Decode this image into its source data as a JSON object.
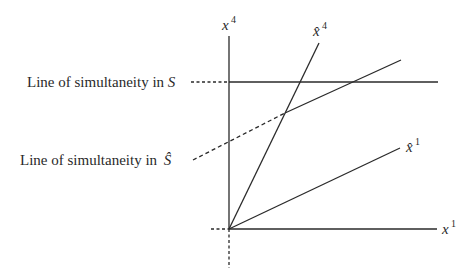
{
  "diagram": {
    "colors": {
      "stroke": "#2a2a2a",
      "background": "#ffffff"
    },
    "axes": {
      "x1": {
        "symbol": "x",
        "superscript": "1"
      },
      "x4": {
        "symbol": "x",
        "superscript": "4"
      }
    },
    "boosted_axes": {
      "x1_hat": {
        "symbol": "x̂",
        "superscript": "1"
      },
      "x4_hat": {
        "symbol": "x̂",
        "superscript": "4"
      }
    },
    "annotations": [
      {
        "id": "simultaneity-S",
        "text": "Line of simultaneity in ",
        "frame": "S"
      },
      {
        "id": "simultaneity-S-hat",
        "text": "Line of simultaneity in ",
        "frame": "Ŝ"
      }
    ]
  }
}
